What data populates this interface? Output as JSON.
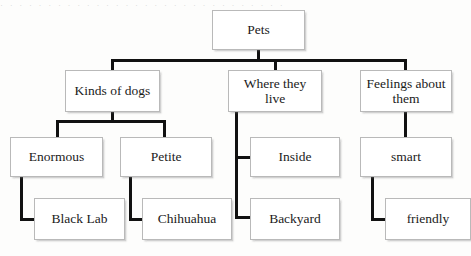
{
  "page": {
    "top_artifact_text": "· · · · · · · · · · · · · · · · · · · · · · · · · · · · · ·",
    "background_color": "#fdfdfc",
    "connector_color": "#111111",
    "box_border_color": "#b9b9b9",
    "box_fill_color": "#ffffff"
  },
  "diagram": {
    "type": "hierarchy-tree",
    "levels": 4,
    "root": "Pets",
    "nodes": [
      {
        "id": "pets",
        "label": "Pets",
        "level": 1,
        "x": 212,
        "y": 10,
        "w": 93,
        "h": 40
      },
      {
        "id": "kinds-of-dogs",
        "label": "Kinds of dogs",
        "level": 2,
        "x": 65,
        "y": 70,
        "w": 95,
        "h": 42
      },
      {
        "id": "where-live",
        "label": "Where they live",
        "level": 2,
        "x": 228,
        "y": 70,
        "w": 94,
        "h": 42
      },
      {
        "id": "feelings",
        "label": "Feelings about them",
        "level": 2,
        "x": 360,
        "y": 70,
        "w": 92,
        "h": 42
      },
      {
        "id": "enormous",
        "label": "Enormous",
        "level": 3,
        "x": 10,
        "y": 137,
        "w": 93,
        "h": 40
      },
      {
        "id": "petite",
        "label": "Petite",
        "level": 3,
        "x": 120,
        "y": 137,
        "w": 92,
        "h": 40
      },
      {
        "id": "inside",
        "label": "Inside",
        "level": 3,
        "x": 250,
        "y": 137,
        "w": 90,
        "h": 40
      },
      {
        "id": "smart",
        "label": "smart",
        "level": 3,
        "x": 360,
        "y": 137,
        "w": 92,
        "h": 40
      },
      {
        "id": "black-lab",
        "label": "Black Lab",
        "level": 4,
        "x": 34,
        "y": 198,
        "w": 91,
        "h": 42
      },
      {
        "id": "chihuahua",
        "label": "Chihuahua",
        "level": 4,
        "x": 142,
        "y": 198,
        "w": 90,
        "h": 42
      },
      {
        "id": "backyard",
        "label": "Backyard",
        "level": 4,
        "x": 250,
        "y": 198,
        "w": 90,
        "h": 42
      },
      {
        "id": "friendly",
        "label": "friendly",
        "level": 4,
        "x": 385,
        "y": 198,
        "w": 86,
        "h": 42
      }
    ],
    "edges": [
      {
        "from": "pets",
        "to": "kinds-of-dogs"
      },
      {
        "from": "pets",
        "to": "where-live"
      },
      {
        "from": "pets",
        "to": "feelings"
      },
      {
        "from": "kinds-of-dogs",
        "to": "enormous"
      },
      {
        "from": "kinds-of-dogs",
        "to": "petite"
      },
      {
        "from": "where-live",
        "to": "inside"
      },
      {
        "from": "where-live",
        "to": "backyard"
      },
      {
        "from": "feelings",
        "to": "smart"
      },
      {
        "from": "enormous",
        "to": "black-lab"
      },
      {
        "from": "petite",
        "to": "chihuahua"
      },
      {
        "from": "smart",
        "to": "friendly"
      }
    ],
    "labels": {
      "pets": "Pets",
      "kinds_of_dogs": "Kinds of dogs",
      "where_they_live": "Where they live",
      "feelings_about_them": "Feelings about them",
      "enormous": "Enormous",
      "petite": "Petite",
      "inside": "Inside",
      "smart": "smart",
      "black_lab": "Black Lab",
      "chihuahua": "Chihuahua",
      "backyard": "Backyard",
      "friendly": "friendly"
    }
  }
}
